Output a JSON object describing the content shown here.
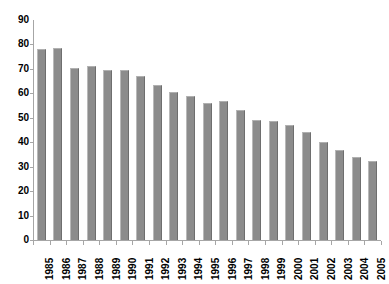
{
  "chart_data": {
    "type": "bar",
    "title": "",
    "subtitle": "",
    "xlabel": "",
    "ylabel": "",
    "ylim": [
      0,
      90
    ],
    "ytick_step": 10,
    "yticks": [
      90,
      80,
      70,
      60,
      50,
      40,
      30,
      20,
      10,
      0
    ],
    "grid": false,
    "legend": false,
    "legend_position": "none",
    "bar_color": "#8c8c8c",
    "axis_color": "#a6a6a6",
    "background_color": "#ffffff",
    "categories": [
      "1985",
      "1986",
      "1987",
      "1988",
      "1989",
      "1990",
      "1991",
      "1992",
      "1993",
      "1994",
      "1995",
      "1996",
      "1997",
      "1998",
      "1999",
      "2000",
      "2001",
      "2002",
      "2003",
      "2004",
      "2005"
    ],
    "values": [
      78,
      78.5,
      70.5,
      71,
      69.5,
      69.5,
      67,
      63.5,
      60.5,
      59,
      56,
      57,
      53,
      49,
      48.5,
      47,
      44,
      40,
      37,
      34,
      32.5
    ],
    "series": [
      {
        "name": "",
        "values": [
          78,
          78.5,
          70.5,
          71,
          69.5,
          69.5,
          67,
          63.5,
          60.5,
          59,
          56,
          57,
          53,
          49,
          48.5,
          47,
          44,
          40,
          37,
          34,
          32.5
        ]
      }
    ]
  }
}
